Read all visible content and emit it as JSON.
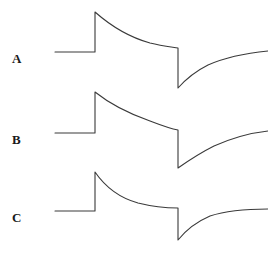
{
  "figure": {
    "background_color": "#ffffff",
    "stroke_color": "#3a3a3a",
    "width": 268,
    "height": 257
  },
  "panels": [
    {
      "id": "a",
      "label": "A"
    },
    {
      "id": "b",
      "label": "B"
    },
    {
      "id": "c",
      "label": "C"
    }
  ],
  "chart_data": {
    "type": "line",
    "title": "",
    "subtitle": "",
    "xlabel": "",
    "ylabel": "",
    "grid": false,
    "legend": false,
    "axes_visible": false,
    "tick_labels": [],
    "annotations": [
      "A",
      "B",
      "C"
    ],
    "xlim": [
      0,
      268
    ],
    "ylim_note": "y axis drawn in screen pixels, smaller y = larger signal",
    "series": [
      {
        "name": "A",
        "label": "A",
        "baseline_y": 52,
        "peak_y": 12,
        "trough_y": 88,
        "recovery_end_y": 51,
        "x_baseline_start": 55,
        "x_step_up": 95,
        "x_step_down": 178,
        "x_end": 268,
        "decay_tau": 70,
        "recovery_tau": 70,
        "path": "M 55 52 L 95 52 L 95 12 C 112 27 132 38 150 43 C 162 46 172 47 178 48 L 178 88 C 186 79 196 71 208 65 C 226 57 248 53 268 51"
      },
      {
        "name": "B",
        "label": "B",
        "baseline_y": 133,
        "peak_y": 92,
        "trough_y": 168,
        "recovery_end_y": 131,
        "x_baseline_start": 55,
        "x_step_up": 95,
        "x_step_down": 178,
        "x_end": 268,
        "decay_tau": 48,
        "recovery_tau": 48,
        "path": "M 55 133 L 95 133 L 95 92 C 110 104 130 114 150 121 C 163 126 172 129 178 130 L 178 168 C 188 161 200 153 214 146 C 232 138 250 133 268 131"
      },
      {
        "name": "C",
        "label": "C",
        "baseline_y": 211,
        "peak_y": 172,
        "trough_y": 240,
        "recovery_end_y": 209,
        "x_baseline_start": 55,
        "x_step_up": 95,
        "x_step_down": 178,
        "x_end": 268,
        "decay_tau": 22,
        "recovery_tau": 22,
        "path": "M 55 211 L 95 211 L 95 172 C 106 188 120 198 138 203 C 154 207 168 208 178 208 L 178 240 C 186 230 196 222 210 216 C 228 210 248 209 268 209"
      }
    ]
  }
}
